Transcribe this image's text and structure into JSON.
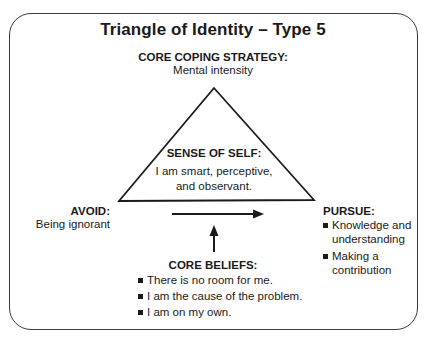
{
  "title": "Triangle of Identity – Type 5",
  "core_coping_strategy": {
    "heading": "CORE COPING STRATEGY:",
    "text": "Mental intensity"
  },
  "sense_of_self": {
    "heading": "SENSE OF SELF:",
    "lines": [
      "I am smart, perceptive,",
      "and observant."
    ]
  },
  "avoid": {
    "heading": "AVOID:",
    "text": "Being ignorant"
  },
  "pursue": {
    "heading": "PURSUE:",
    "items": [
      "Knowledge and understanding",
      "Making a contribution"
    ]
  },
  "core_beliefs": {
    "heading": "CORE BELIEFS:",
    "items": [
      "There is no room for me.",
      "I am the cause of the problem.",
      "I am on my own."
    ]
  },
  "icons": {
    "horizontal_arrow": "arrow-right-icon",
    "vertical_arrow": "arrow-up-icon",
    "bullet": "square-bullet-icon"
  }
}
